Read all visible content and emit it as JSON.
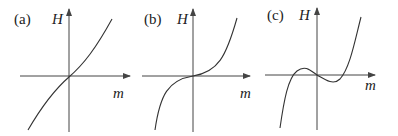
{
  "figure": {
    "panels": [
      {
        "label": "(a)",
        "y_axis": "H",
        "x_axis": "m",
        "description": "monotonic curve through origin, steep at ends"
      },
      {
        "label": "(b)",
        "y_axis": "H",
        "x_axis": "m",
        "description": "cubic-like curve, flat at origin"
      },
      {
        "label": "(c)",
        "y_axis": "H",
        "x_axis": "m",
        "description": "cubic curve with local max left of origin and local min right of origin"
      }
    ]
  }
}
